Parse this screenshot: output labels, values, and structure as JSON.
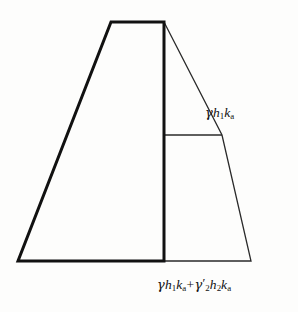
{
  "figure": {
    "background_color": "#fdfdfc",
    "stroke_color": "#111111",
    "thick_stroke_width": 3.0,
    "thin_stroke_width": 1.3,
    "wall_polygon": [
      {
        "x": 111,
        "y": 22
      },
      {
        "x": 164,
        "y": 22
      },
      {
        "x": 164,
        "y": 261
      },
      {
        "x": 18,
        "y": 261
      }
    ],
    "pressure_polygon": [
      {
        "x": 164,
        "y": 22
      },
      {
        "x": 222,
        "y": 135
      },
      {
        "x": 251,
        "y": 261
      },
      {
        "x": 164,
        "y": 261
      }
    ],
    "divider_line": {
      "x1": 164,
      "y1": 135,
      "x2": 222,
      "y2": 135
    }
  },
  "labels": {
    "top": {
      "text": "γh1ka",
      "gamma": "γ",
      "h": "h",
      "h_sub": "1",
      "k": "k",
      "k_sub": "a"
    },
    "bottom": {
      "text": "γh1ka+γ'2h2ka",
      "term1_gamma": "γ",
      "term1_h": "h",
      "term1_h_sub": "1",
      "term1_k": "k",
      "term1_k_sub": "a",
      "operator": "+",
      "term2_gamma": "γ",
      "term2_prime": "′",
      "term2_gamma_sub": "2",
      "term2_h": "h",
      "term2_h_sub": "2",
      "term2_k": "k",
      "term2_k_sub": "a"
    }
  }
}
